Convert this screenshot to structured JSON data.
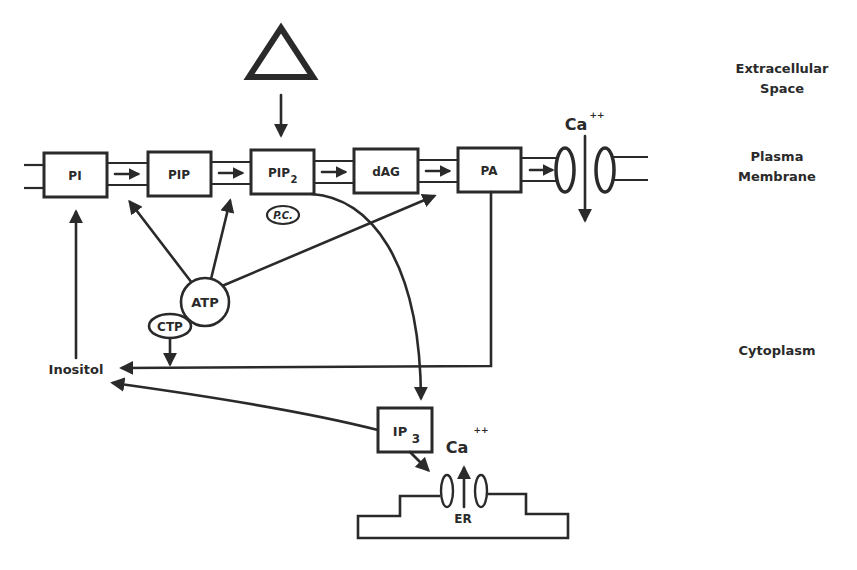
{
  "diagram": {
    "regions": {
      "extracellular_line1": "Extracellular",
      "extracellular_line2": "Space",
      "membrane_line1": "Plasma",
      "membrane_line2": "Membrane",
      "cytoplasm": "Cytoplasm"
    },
    "membrane_nodes": [
      {
        "id": "pi",
        "label": "PI"
      },
      {
        "id": "pip",
        "label": "PIP"
      },
      {
        "id": "pip2",
        "label": "PIP",
        "subscript": "2"
      },
      {
        "id": "dag",
        "label": "dAG"
      },
      {
        "id": "pa",
        "label": "PA"
      }
    ],
    "enzymes": {
      "pc": "P.C.",
      "atp": "ATP",
      "ctp": "CTP"
    },
    "cytoplasm_nodes": {
      "inositol": "Inositol",
      "ip3_label": "IP",
      "ip3_sub": "3"
    },
    "calcium": {
      "plasma_label": "Ca",
      "plasma_charge": "++",
      "er_label": "Ca",
      "er_charge": "++"
    },
    "er_label": "ER",
    "stimulus": "triangle-receptor",
    "colors": {
      "ink": "#2a2a2a",
      "background": "#ffffff"
    }
  }
}
